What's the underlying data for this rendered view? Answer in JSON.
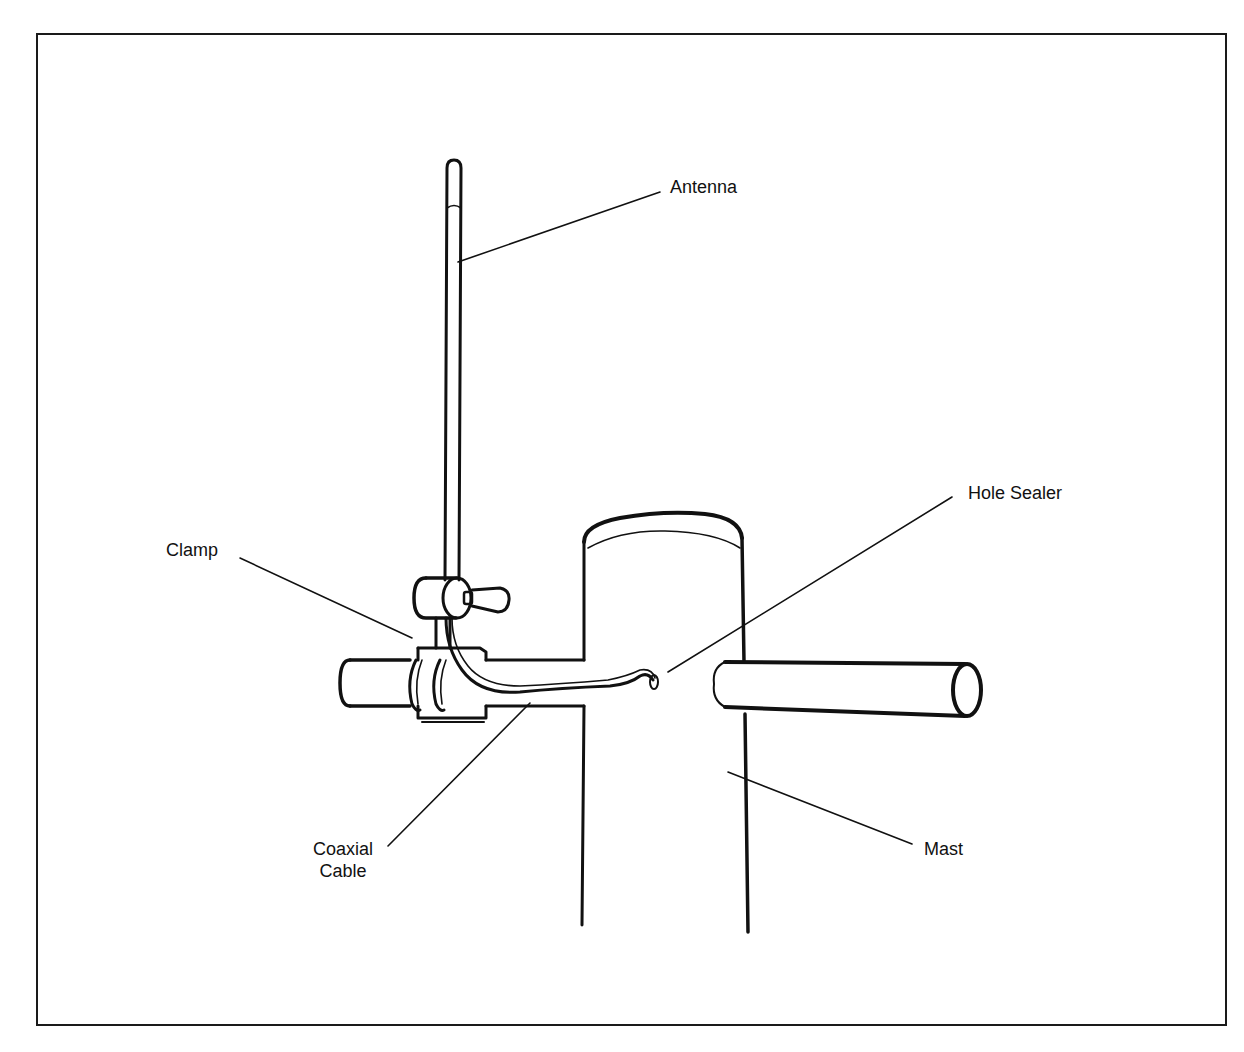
{
  "diagram": {
    "labels": {
      "antenna": "Antenna",
      "clamp": "Clamp",
      "hole_sealer": "Hole Sealer",
      "coaxial_cable_line1": "Coaxial",
      "coaxial_cable_line2": "Cable",
      "mast": "Mast"
    },
    "colors": {
      "ink": "#111111",
      "paper": "#ffffff"
    }
  }
}
